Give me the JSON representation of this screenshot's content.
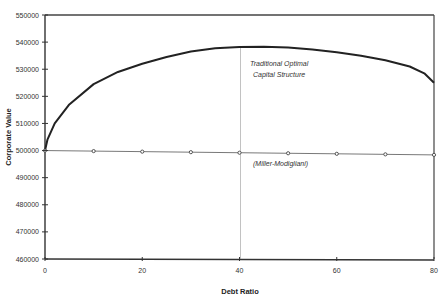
{
  "chart_data": {
    "type": "line",
    "title": "",
    "xlabel": "Debt Ratio",
    "ylabel": "Corporate Value",
    "xlim": [
      0,
      80
    ],
    "ylim": [
      460000,
      550000
    ],
    "x_ticks": [
      0,
      20,
      40,
      60,
      80
    ],
    "y_ticks": [
      460000,
      470000,
      480000,
      490000,
      500000,
      510000,
      520000,
      530000,
      540000,
      550000
    ],
    "grid": false,
    "legend": "none",
    "series": [
      {
        "name": "Traditional",
        "style": "thick line, no markers",
        "x": [
          0,
          0.5,
          2,
          5,
          10,
          15,
          20,
          25,
          30,
          35,
          40,
          45,
          50,
          55,
          60,
          65,
          70,
          75,
          78,
          80
        ],
        "values": [
          500000,
          504000,
          510000,
          517000,
          524500,
          529000,
          532000,
          534500,
          536500,
          537700,
          538200,
          538300,
          538000,
          537300,
          536300,
          535000,
          533300,
          531000,
          528500,
          525000
        ]
      },
      {
        "name": "Miller-Modigliani",
        "style": "thin line with circle markers",
        "x": [
          0,
          10,
          20,
          30,
          40,
          50,
          60,
          70,
          80
        ],
        "values": [
          500000,
          499800,
          499600,
          499400,
          499200,
          499000,
          498800,
          498600,
          498400
        ]
      }
    ],
    "reference_lines": [
      {
        "orientation": "vertical",
        "x": 40,
        "label": "optimal debt ratio"
      }
    ],
    "annotations": [
      {
        "text": "Traditional Optimal",
        "x": 48,
        "y": 534500
      },
      {
        "text": "Capital Structure",
        "x": 48,
        "y": 531000
      },
      {
        "text": "(Miller-Modigliani)",
        "x": 49,
        "y": 494500
      }
    ]
  },
  "labels": {
    "xlabel": "Debt Ratio",
    "ylabel": "Corporate Value",
    "annot_traditional_1": "Traditional Optimal",
    "annot_traditional_2": "Capital Structure",
    "annot_mm": "(Miller-Modigliani)"
  },
  "y_tick_labels": [
    "550000",
    "540000",
    "530000",
    "520000",
    "510000",
    "500000",
    "490000",
    "480000",
    "470000",
    "460000"
  ],
  "x_tick_labels": [
    "0",
    "20",
    "40",
    "60",
    "80"
  ]
}
